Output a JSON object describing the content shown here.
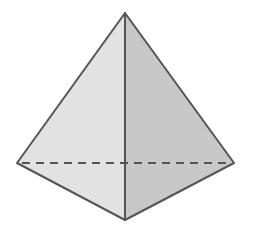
{
  "diagram": {
    "type": "tetrahedron",
    "vertices": {
      "apex": [
        125,
        13
      ],
      "left": [
        17,
        163
      ],
      "right": [
        234,
        163
      ],
      "front": [
        125,
        220
      ]
    },
    "colors": {
      "left_face": "#e2e2e2",
      "right_face": "#c8c8c8",
      "edge": "#555555",
      "background": "#ffffff"
    }
  }
}
